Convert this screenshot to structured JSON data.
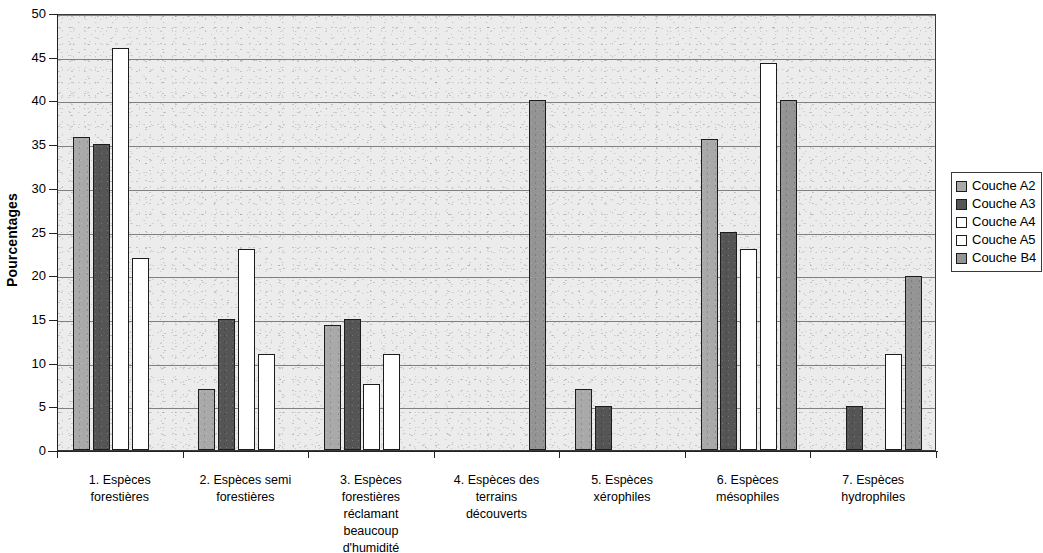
{
  "chart_data": {
    "type": "bar",
    "title": "",
    "xlabel": "",
    "ylabel": "Pourcentages",
    "ylim": [
      0,
      50
    ],
    "ytick_step": 5,
    "yticks": [
      "0",
      "5",
      "10",
      "15",
      "20",
      "25",
      "30",
      "35",
      "40",
      "45",
      "50"
    ],
    "grid": true,
    "legend_position": "right",
    "categories": [
      "1. Espèces forestières",
      "2. Espèces semi forestières",
      "3. Espèces forestières réclamant beaucoup d'humidité",
      "4. Espèces des terrains découverts",
      "5. Espèces xérophiles",
      "6. Espèces mésophiles",
      "7. Espèces hydrophiles"
    ],
    "category_lines": [
      [
        "1. Espèces",
        "forestières"
      ],
      [
        "2. Espèces semi",
        "forestières"
      ],
      [
        "3. Espèces",
        "forestières",
        "réclamant",
        "beaucoup",
        "d'humidité"
      ],
      [
        "4. Espèces des",
        "terrains",
        "découverts"
      ],
      [
        "5. Espèces",
        "xérophiles"
      ],
      [
        "6. Espèces",
        "mésophiles"
      ],
      [
        "7. Espèces",
        "hydrophiles"
      ]
    ],
    "series": [
      {
        "name": "Couche A2",
        "key": "A2",
        "color": "#a9a9a9",
        "values": [
          35.8,
          7,
          14.3,
          null,
          7,
          35.6,
          null
        ]
      },
      {
        "name": "Couche A3",
        "key": "A3",
        "color": "#555555",
        "values": [
          35,
          15,
          15,
          null,
          5,
          25,
          5
        ]
      },
      {
        "name": "Couche A4",
        "key": "A4",
        "color": "#ffffff",
        "values": [
          46,
          23,
          7.5,
          null,
          null,
          23,
          null
        ]
      },
      {
        "name": "Couche A5",
        "key": "A5",
        "color": "#ffffff",
        "values": [
          22,
          11,
          11,
          null,
          null,
          44.3,
          11
        ]
      },
      {
        "name": "Couche B4",
        "key": "B4",
        "color": "#949494",
        "values": [
          null,
          null,
          null,
          40,
          null,
          40,
          19.9
        ]
      }
    ]
  },
  "legend": {
    "items": [
      {
        "label": "Couche A2",
        "key": "A2"
      },
      {
        "label": "Couche A3",
        "key": "A3"
      },
      {
        "label": "Couche A4",
        "key": "A4"
      },
      {
        "label": "Couche A5",
        "key": "A5"
      },
      {
        "label": "Couche B4",
        "key": "B4"
      }
    ]
  },
  "colors": {
    "plot_background": "#ececec",
    "gridline": "#808080",
    "axis": "#222222",
    "bar_outline": "#1c1c1c"
  }
}
